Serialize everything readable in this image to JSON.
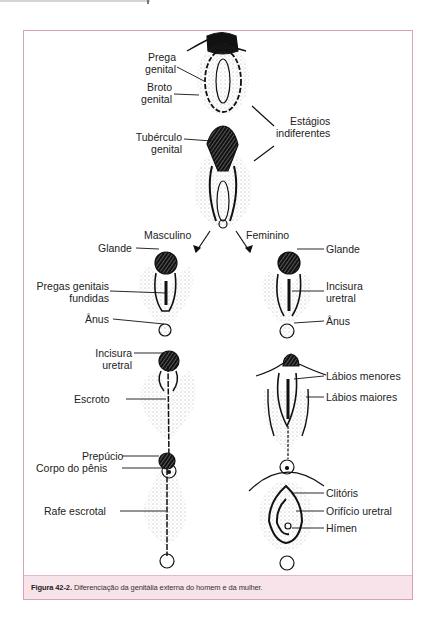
{
  "page": {
    "frame_border_color": "#d9a3ab",
    "caption_bg_color": "#f9e3ea"
  },
  "figure": {
    "labels": {
      "prega_genital": [
        "Prega",
        "genital"
      ],
      "broto_genital": [
        "Broto",
        "genital"
      ],
      "estagios_indiferentes": [
        "Estágios",
        "indiferentes"
      ],
      "tuberculo_genital": [
        "Tubérculo",
        "genital"
      ],
      "masculino": "Masculino",
      "feminino": "Feminino",
      "male_glande": "Glande",
      "female_glande": "Glande",
      "pregas_genitais_fundidas": [
        "Pregas genitais",
        "fundidas"
      ],
      "female_incisura_uretral": [
        "Incisura",
        "uretral"
      ],
      "male_anus": "Ânus",
      "female_anus": "Ânus",
      "male_incisura_uretral": [
        "Incisura",
        "uretral"
      ],
      "labios_menores": "Lábios menores",
      "labios_maiores": "Lábios maiores",
      "escroto": "Escroto",
      "prepucio": "Prepúcio",
      "corpo_do_penis": "Corpo do pênis",
      "rafe_escrotal": "Rafe escrotal",
      "clitoris": "Clitóris",
      "orificio_uretral": "Orifício uretral",
      "himen": "Hímen"
    },
    "caption": {
      "number": "Figura 42-2.",
      "text": " Diferenciação da genitália externa do homem e da mulher."
    }
  }
}
